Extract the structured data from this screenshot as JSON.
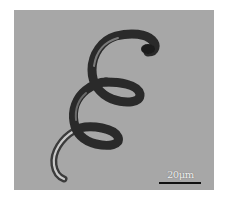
{
  "figure": {
    "background_color": "#a7a7a7",
    "structure_color": "#2a2a2a",
    "scale_bar": {
      "label": "20μm",
      "color": "#111111"
    }
  }
}
